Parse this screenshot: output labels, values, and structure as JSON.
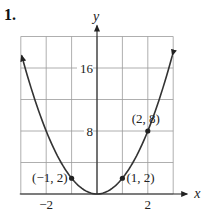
{
  "figure": {
    "number_label": "1."
  },
  "chart_data": {
    "type": "line",
    "title": "",
    "function": "y = 2x^2",
    "xlabel": "x",
    "ylabel": "y",
    "xlim": [
      -3,
      3
    ],
    "ylim": [
      0,
      20
    ],
    "grid": true,
    "x_grid_step": 1,
    "y_grid_step": 4,
    "x_ticks": [
      {
        "value": -2,
        "label": "−2"
      },
      {
        "value": 2,
        "label": "2"
      }
    ],
    "y_ticks": [
      {
        "value": 8,
        "label": "8"
      },
      {
        "value": 16,
        "label": "16"
      }
    ],
    "curve_color": "#333333",
    "curve_arrows": "both-ends",
    "points": [
      {
        "x": -1,
        "y": 2,
        "label": "(−1, 2)"
      },
      {
        "x": 1,
        "y": 2,
        "label": "(1, 2)"
      },
      {
        "x": 2,
        "y": 8,
        "label": "(2, 8)"
      }
    ]
  }
}
